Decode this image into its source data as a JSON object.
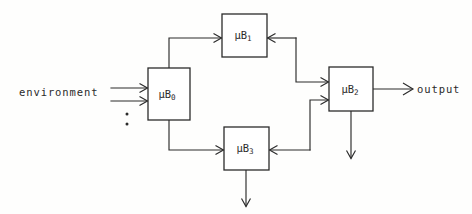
{
  "diagram": {
    "background_color": "#fefefd",
    "line_color": "#2b2b2b",
    "blocks": [
      {
        "id": "mub0",
        "name": "mu-b-0",
        "label": "μB",
        "subscript": "0",
        "x": 148,
        "y": 68,
        "w": 42,
        "h": 52
      },
      {
        "id": "mub1",
        "name": "mu-b-1",
        "label": "μB",
        "subscript": "1",
        "x": 222,
        "y": 14,
        "w": 45,
        "h": 43
      },
      {
        "id": "mub3",
        "name": "mu-b-3",
        "label": "μB",
        "subscript": "3",
        "x": 224,
        "y": 127,
        "w": 45,
        "h": 43
      },
      {
        "id": "mub2",
        "name": "mu-b-2",
        "label": "μB",
        "subscript": "2",
        "x": 329,
        "y": 67,
        "w": 44,
        "h": 44
      }
    ],
    "labels": {
      "environment": "environment",
      "output": "output"
    },
    "ellipsis": "⋮",
    "edges": [
      {
        "name": "environment-input-1",
        "from": "environment",
        "to": "mu-b-0"
      },
      {
        "name": "environment-input-2",
        "from": "environment",
        "to": "mu-b-0"
      },
      {
        "name": "mu-b-0-to-mu-b-1",
        "from": "mu-b-0",
        "to": "mu-b-1"
      },
      {
        "name": "mu-b-0-to-mu-b-3",
        "from": "mu-b-0",
        "to": "mu-b-3"
      },
      {
        "name": "feedback-to-mu-b-1",
        "from": "trunk-upper",
        "to": "mu-b-1"
      },
      {
        "name": "feedback-to-mu-b-3",
        "from": "trunk-lower",
        "to": "mu-b-3"
      },
      {
        "name": "trunk-upper-to-mu-b-2",
        "from": "trunk-upper",
        "to": "mu-b-2"
      },
      {
        "name": "trunk-lower-to-mu-b-2",
        "from": "trunk-lower",
        "to": "mu-b-2"
      },
      {
        "name": "mu-b-2-to-output",
        "from": "mu-b-2",
        "to": "output"
      },
      {
        "name": "mu-b-2-down-output",
        "from": "mu-b-2",
        "to": "down"
      },
      {
        "name": "mu-b-3-down-output",
        "from": "mu-b-3",
        "to": "down"
      }
    ]
  }
}
